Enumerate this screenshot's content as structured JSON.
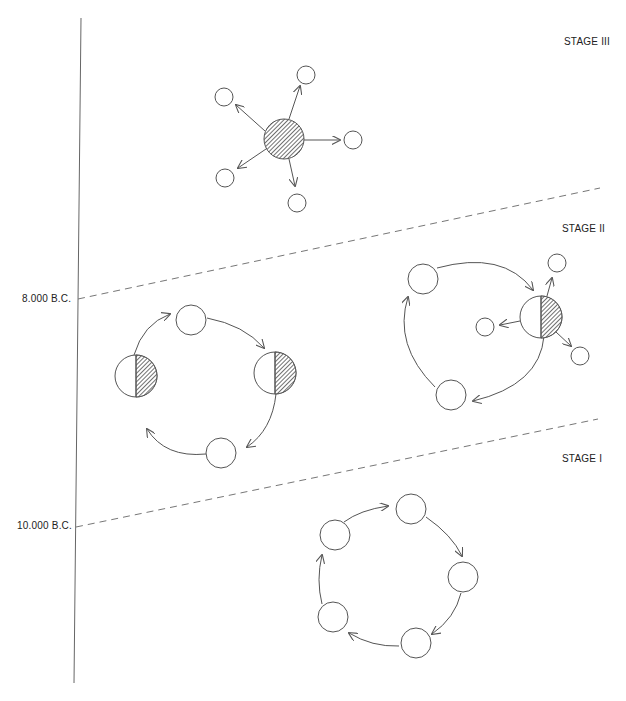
{
  "diagram": {
    "type": "stage diagram of settlement/mobility patterns",
    "time_axis": {
      "markers": [
        {
          "label": "8.000 B.C."
        },
        {
          "label": "10.000 B.C."
        }
      ]
    },
    "stages": [
      {
        "label": "STAGE III",
        "pattern": "central shaded site radiating arrows to 5 small satellite sites"
      },
      {
        "label": "STAGE II",
        "pattern": "cycle of 4 sites (2 half-shaded) and cycle of 3 sites with one half-shaded site radiating to 3 satellites"
      },
      {
        "label": "STAGE I",
        "pattern": "cycle of 5 unshaded sites connected by arrows"
      }
    ],
    "colors": {
      "line": "#555555",
      "hatch": "#444444",
      "background": "#ffffff"
    }
  }
}
